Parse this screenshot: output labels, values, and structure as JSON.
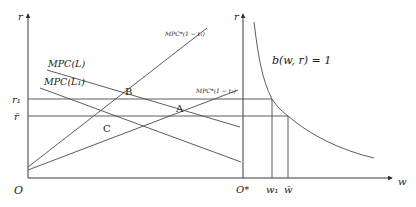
{
  "diagram": {
    "left_panel": {
      "y_axis_label": "r",
      "origin_label": "O",
      "rate_labels": {
        "r1": "r₁",
        "rbar": "r̄"
      },
      "lines": {
        "mpc_star_t1": "MPC*(1 − t₁)",
        "mpc_star_t2": "MPC*(1 − t₂)",
        "mpc_L": "MPC(L)",
        "mpc_L1": "MPC(L₁)"
      },
      "points": {
        "A": "A",
        "B": "B",
        "C": "C"
      }
    },
    "right_panel": {
      "y_axis_label": "r",
      "origin_label": "O*",
      "x_axis_label": "w",
      "curve_label": "b(w, r) = 1",
      "w_labels": {
        "w1": "w₁",
        "wbar": "w̄"
      }
    }
  }
}
